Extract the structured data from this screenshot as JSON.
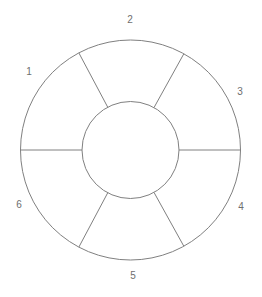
{
  "figure": {
    "kind": "annulus-sector-diagram",
    "background_color": "#ffffff",
    "stroke_color": "#808080",
    "stroke_width": 1,
    "label_color": "#6e6e6e",
    "label_font_size": 10,
    "geometry": {
      "center_x": 130.5,
      "center_y": 150,
      "outer_radius": 110,
      "inner_radius": 48.5,
      "sector_count": 6,
      "divider_angles_deg": [
        0,
        61,
        118,
        180,
        242,
        299
      ]
    }
  },
  "labels": [
    {
      "text": "1",
      "x": 29,
      "y": 72,
      "name": "sector-label-1"
    },
    {
      "text": "2",
      "x": 130,
      "y": 20,
      "name": "sector-label-2"
    },
    {
      "text": "3",
      "x": 240,
      "y": 92,
      "name": "sector-label-3"
    },
    {
      "text": "4",
      "x": 241,
      "y": 207,
      "name": "sector-label-4"
    },
    {
      "text": "5",
      "x": 133,
      "y": 276,
      "name": "sector-label-5"
    },
    {
      "text": "6",
      "x": 19,
      "y": 205,
      "name": "sector-label-6"
    }
  ],
  "sectors": [
    {
      "id": 1,
      "label": "1",
      "start_angle_deg": 118,
      "end_angle_deg": 180
    },
    {
      "id": 2,
      "label": "2",
      "start_angle_deg": 61,
      "end_angle_deg": 118
    },
    {
      "id": 3,
      "label": "3",
      "start_angle_deg": 0,
      "end_angle_deg": 61
    },
    {
      "id": 4,
      "label": "4",
      "start_angle_deg": 299,
      "end_angle_deg": 360
    },
    {
      "id": 5,
      "label": "5",
      "start_angle_deg": 242,
      "end_angle_deg": 299
    },
    {
      "id": 6,
      "label": "6",
      "start_angle_deg": 180,
      "end_angle_deg": 242
    }
  ]
}
